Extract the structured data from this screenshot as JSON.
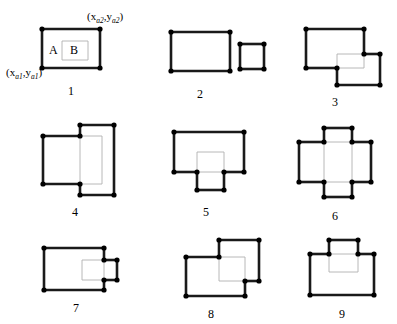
{
  "figure": {
    "title": "",
    "background": "#ffffff",
    "width": 397,
    "height": 324,
    "stroke_visible_color": "#1a1a1a",
    "stroke_hidden_color": "#b0b0b0",
    "vertex_color": "#000000",
    "stroke_visible_width": 2.6,
    "stroke_hidden_width": 0.9,
    "vertex_radius": 2.6
  },
  "annotations": {
    "corner_max_label": "(x",
    "corner_max_sub1": "a2",
    "corner_max_mid": ",y",
    "corner_max_sub2": "a2",
    "corner_max_end": ")",
    "corner_min_label": "(x",
    "corner_min_sub1": "a1",
    "corner_min_mid": ",y",
    "corner_min_sub2": "a1",
    "corner_min_end": ")",
    "rect_a_label": "A",
    "rect_b_label": "B"
  },
  "panels": [
    {
      "number": "1",
      "caption": "1",
      "relation": "B contained inside A",
      "rect_a": {
        "x1": 42,
        "y1": 29,
        "x2": 100,
        "y2": 68
      },
      "rect_b": {
        "x1": 62,
        "y1": 41,
        "x2": 88,
        "y2": 60
      }
    },
    {
      "number": "2",
      "caption": "2",
      "relation": "A and B disjoint",
      "rect_a": {
        "x1": 171,
        "y1": 32,
        "x2": 230,
        "y2": 71
      },
      "rect_b": {
        "x1": 240,
        "y1": 44,
        "x2": 264,
        "y2": 69
      }
    },
    {
      "number": "3",
      "caption": "3",
      "relation": "corner overlap lower-right",
      "rect_a": {
        "x1": 306,
        "y1": 29,
        "x2": 364,
        "y2": 68
      },
      "rect_b": {
        "x1": 337,
        "y1": 54,
        "x2": 380,
        "y2": 85
      }
    },
    {
      "number": "4",
      "caption": "4",
      "relation": "overlap right side, B taller",
      "rect_a": {
        "x1": 43,
        "y1": 136,
        "x2": 102,
        "y2": 184
      },
      "rect_b": {
        "x1": 80,
        "y1": 125,
        "x2": 114,
        "y2": 195
      }
    },
    {
      "number": "5",
      "caption": "5",
      "relation": "B straddles bottom edge of A",
      "rect_a": {
        "x1": 174,
        "y1": 132,
        "x2": 244,
        "y2": 172
      },
      "rect_b": {
        "x1": 197,
        "y1": 152,
        "x2": 224,
        "y2": 190
      }
    },
    {
      "number": "6",
      "caption": "6",
      "relation": "cross shape, B spans vertically through A",
      "rect_a": {
        "x1": 299,
        "y1": 142,
        "x2": 371,
        "y2": 182
      },
      "rect_b": {
        "x1": 324,
        "y1": 128,
        "x2": 352,
        "y2": 197
      }
    },
    {
      "number": "7",
      "caption": "7",
      "relation": "B straddles right edge of A",
      "rect_a": {
        "x1": 44,
        "y1": 248,
        "x2": 104,
        "y2": 290
      },
      "rect_b": {
        "x1": 82,
        "y1": 260,
        "x2": 117,
        "y2": 280
      }
    },
    {
      "number": "8",
      "caption": "8",
      "relation": "corner overlap upper-right",
      "rect_a": {
        "x1": 186,
        "y1": 257,
        "x2": 245,
        "y2": 296
      },
      "rect_b": {
        "x1": 219,
        "y1": 240,
        "x2": 259,
        "y2": 281
      }
    },
    {
      "number": "9",
      "caption": "9",
      "relation": "B straddles top edge of A",
      "rect_a": {
        "x1": 310,
        "y1": 254,
        "x2": 374,
        "y2": 295
      },
      "rect_b": {
        "x1": 329,
        "y1": 240,
        "x2": 358,
        "y2": 272
      }
    }
  ],
  "captions_pos": [
    {
      "x": 71,
      "y": 85
    },
    {
      "x": 200,
      "y": 88
    },
    {
      "x": 335,
      "y": 96
    },
    {
      "x": 75,
      "y": 206
    },
    {
      "x": 206,
      "y": 206
    },
    {
      "x": 335,
      "y": 210
    },
    {
      "x": 76,
      "y": 302
    },
    {
      "x": 211,
      "y": 308
    },
    {
      "x": 342,
      "y": 308
    }
  ]
}
